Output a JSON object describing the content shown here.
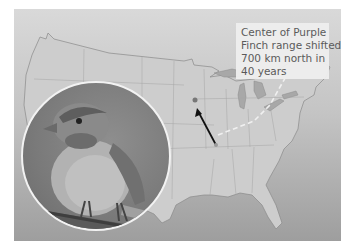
{
  "figure": {
    "callout": {
      "lines": [
        "Center of Purple",
        "Finch range shifted",
        "700 km north in",
        "40 years"
      ]
    },
    "map": {
      "region": "Contiguous United States",
      "arrow": {
        "from": "southern Illinois / Kentucky border",
        "to": "Iowa / Wisconsin area",
        "direction": "north"
      },
      "dashed_line": "range boundary across Great Lakes / Ohio region"
    },
    "photo": {
      "subject": "Purple Finch perched on a branch",
      "shape": "circle"
    },
    "colors": {
      "land": "#c9c9c9",
      "water": "#9a9a9a",
      "callout_bg": "#efefef",
      "arrow": "#111111",
      "circle_border": "#f2f2f2"
    }
  }
}
